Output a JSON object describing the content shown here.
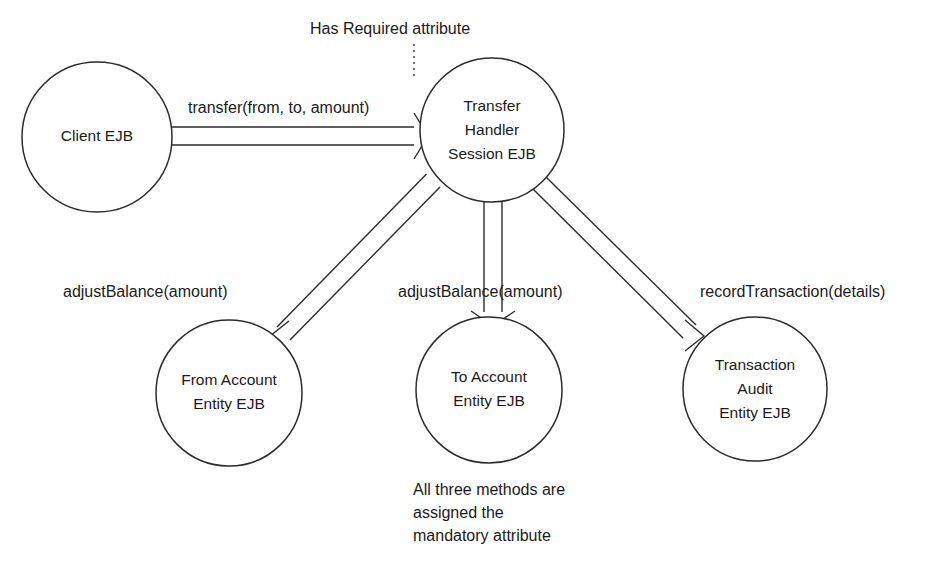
{
  "diagram": {
    "background_color": "#ffffff",
    "stroke_color": "#2b2b2b",
    "text_color": "#1a1a1a",
    "nodes": [
      {
        "id": "client",
        "shape": "circle",
        "cx": 97,
        "cy": 137,
        "r": 75,
        "lines": [
          "Client EJB"
        ]
      },
      {
        "id": "transfer-handler",
        "shape": "circle",
        "cx": 492,
        "cy": 130,
        "r": 72,
        "lines": [
          "Transfer",
          "Handler",
          "Session EJB"
        ]
      },
      {
        "id": "from-account",
        "shape": "circle",
        "cx": 229,
        "cy": 393,
        "r": 73,
        "lines": [
          "From Account",
          "Entity EJB"
        ]
      },
      {
        "id": "to-account",
        "shape": "circle",
        "cx": 489,
        "cy": 390,
        "r": 73,
        "lines": [
          "To Account",
          "Entity EJB"
        ]
      },
      {
        "id": "transaction-audit",
        "shape": "circle",
        "cx": 755,
        "cy": 389,
        "r": 72,
        "lines": [
          "Transaction",
          "Audit",
          "Entity EJB"
        ]
      }
    ],
    "edges": [
      {
        "id": "client-to-handler",
        "from": "client",
        "to": "transfer-handler",
        "label": "transfer(from, to, amount)",
        "label_x": 188,
        "label_y": 113,
        "style": "double-line-open-arrow"
      },
      {
        "id": "handler-to-from-account",
        "from": "transfer-handler",
        "to": "from-account",
        "label": "adjustBalance(amount)",
        "label_x": 63,
        "label_y": 297,
        "style": "double-line-open-arrow"
      },
      {
        "id": "handler-to-to-account",
        "from": "transfer-handler",
        "to": "to-account",
        "label": "adjustBalance(amount)",
        "label_x": 398,
        "label_y": 297,
        "style": "double-line-open-arrow"
      },
      {
        "id": "handler-to-transaction-audit",
        "from": "transfer-handler",
        "to": "transaction-audit",
        "label": "recordTransaction(details)",
        "label_x": 700,
        "label_y": 297,
        "style": "double-line-open-arrow"
      }
    ],
    "annotations": [
      {
        "id": "required-attribute-note",
        "text": "Has Required attribute",
        "x": 310,
        "y": 34,
        "leader": {
          "x1": 414,
          "y1": 44,
          "x2": 414,
          "y2": 76
        }
      },
      {
        "id": "mandatory-attribute-note",
        "x": 413,
        "lines": [
          {
            "text": "All three methods are",
            "y": 495
          },
          {
            "text": "assigned the",
            "y": 518
          },
          {
            "text": "mandatory attribute",
            "y": 541
          }
        ]
      }
    ]
  }
}
